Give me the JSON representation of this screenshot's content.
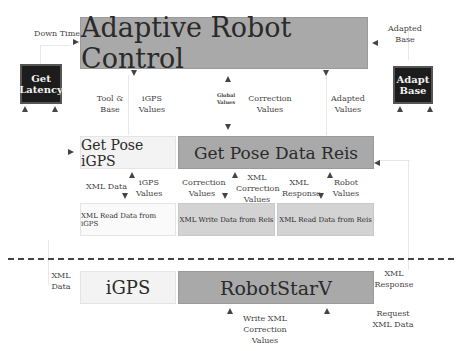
{
  "title": "Adaptive Robot Control",
  "boxes": {
    "adaptive": "Adaptive Robot Control",
    "get_latency": "Get Latency",
    "adapt_base": "Adapt Base",
    "pose_igps": "Get Pose iGPS",
    "pose_reis": "Get Pose Data Reis",
    "xml_read_igps": "XML Read Data from iGPS",
    "xml_write_reis": "XML Write Data from Reis",
    "xml_read_reis": "XML Read Data from Reis",
    "igps": "iGPS",
    "robotstarv": "RobotStarV"
  },
  "labels": {
    "down_time": "Down Time",
    "adapted_base": "Adapted Base",
    "tool_base": "Tool & Base",
    "igps_values_top": "iGPS Values",
    "global_values": "Global Values",
    "correction_values_top": "Correction Values",
    "adapted_values": "Adapted Values",
    "xml_data_mid": "XML Data",
    "igps_values_mid": "iGPS Values",
    "correction_values_mid": "Correction Values",
    "xml_correction_values": "XML Correction Values",
    "xml_response_mid": "XML Response",
    "robot_values": "Robot Values",
    "xml_data_bottom": "XML Data",
    "xml_response_bottom": "XML Response",
    "request_xml_data": "Request XML Data",
    "write_xml_correction": "Write XML Correction Values"
  },
  "colors": {
    "dark_box": "#1c1c1c",
    "gray_box": "#a9a9a9",
    "light_gray_box": "#d3d3d3",
    "light_box": "#f3f3f3",
    "dashed_line": "#444444"
  }
}
